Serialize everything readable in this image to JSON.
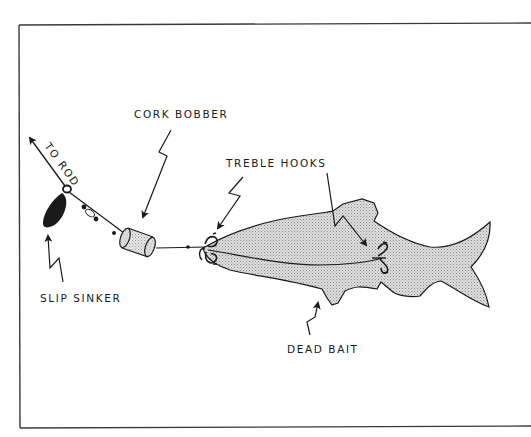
{
  "diagram": {
    "type": "fishing rig illustration",
    "labels": {
      "cork_bobber": "CORK BOBBER",
      "to_rod": "TO ROD",
      "treble_hooks": "TREBLE HOOKS",
      "slip_sinker": "SLIP SINKER",
      "dead_bait": "DEAD BAIT"
    },
    "components": [
      {
        "id": "line",
        "name": "fishing line"
      },
      {
        "id": "slip_sinker",
        "name": "slip sinker"
      },
      {
        "id": "swivel",
        "name": "swivel / beads"
      },
      {
        "id": "cork_bobber",
        "name": "cork bobber"
      },
      {
        "id": "treble_hook_head",
        "name": "treble hook (head)"
      },
      {
        "id": "treble_hook_body",
        "name": "treble hook (body)"
      },
      {
        "id": "dead_bait",
        "name": "dead bait fish"
      }
    ],
    "colors": {
      "ink": "#1a1a1a",
      "fish_fill": "#dcdcdc",
      "frame": "#3a3a3a",
      "background": "#ffffff"
    }
  }
}
